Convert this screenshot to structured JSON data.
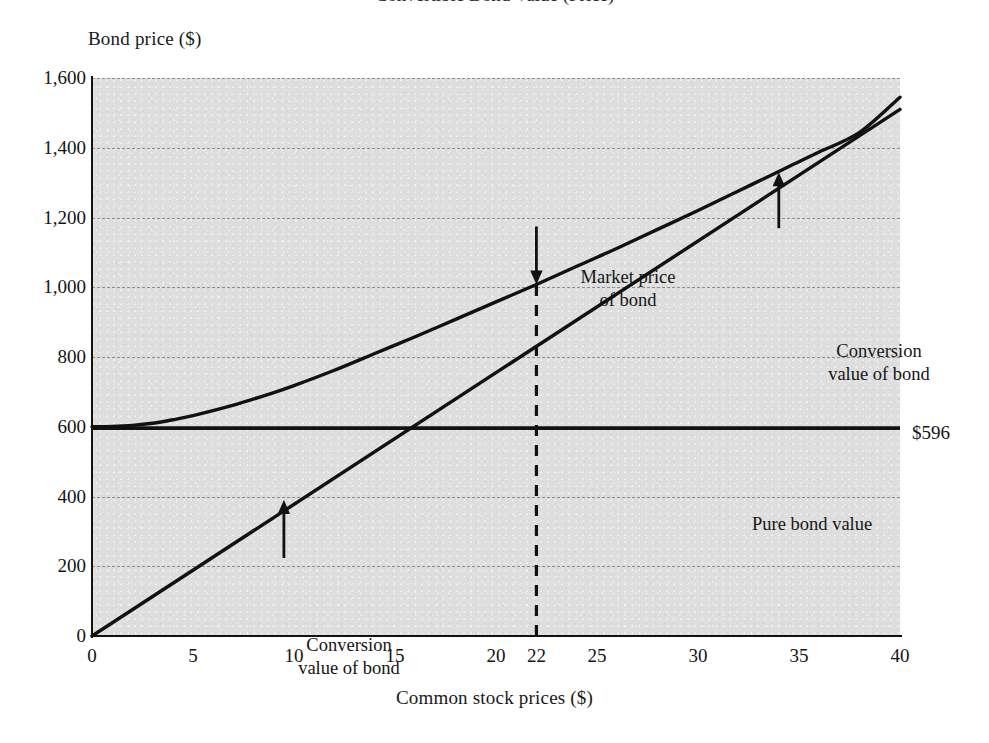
{
  "figure": {
    "title_cut_off": "Convertible Bond Value (Price)",
    "background_color": "#dedede",
    "line_color": "#111111",
    "grid_color": "#8e8e8e"
  },
  "chart_data": {
    "type": "line",
    "title": "",
    "xlabel": "Common stock prices ($)",
    "ylabel": "Bond price ($)",
    "xlim": [
      0,
      40
    ],
    "ylim": [
      0,
      1600
    ],
    "grid": true,
    "legend": "none",
    "xticks": [
      0,
      5,
      10,
      15,
      20,
      22,
      25,
      30,
      35,
      40
    ],
    "xticklabels": [
      "0",
      "5",
      "10",
      "15",
      "20",
      "22",
      "25",
      "30",
      "35",
      "40"
    ],
    "yticks": [
      0,
      200,
      400,
      600,
      800,
      1000,
      1200,
      1400,
      1600
    ],
    "yticklabels": [
      "0",
      "200",
      "400",
      "600",
      "800",
      "1,000",
      "1,200",
      "1,400",
      "1,600"
    ],
    "series": [
      {
        "name": "Market price of bond",
        "style": "solid-curve",
        "x": [
          0,
          1,
          2,
          3,
          4,
          5,
          7,
          9,
          10,
          12,
          14,
          15,
          16,
          18,
          20,
          22,
          24,
          25,
          26,
          28,
          30,
          32,
          34,
          35,
          36,
          38,
          40
        ],
        "values": [
          600,
          601,
          604,
          610,
          620,
          632,
          662,
          698,
          718,
          762,
          810,
          834,
          858,
          908,
          958,
          1008,
          1060,
          1086,
          1112,
          1166,
          1220,
          1276,
          1332,
          1360,
          1388,
          1444,
          1545
        ]
      },
      {
        "name": "Conversion value of bond",
        "style": "solid-straight",
        "x": [
          0,
          40
        ],
        "values": [
          0,
          1510
        ]
      },
      {
        "name": "Pure bond value",
        "style": "solid-horizontal",
        "x": [
          0,
          40
        ],
        "values": [
          596,
          596
        ]
      }
    ],
    "reference_lines": [
      {
        "name": "market-price-marker",
        "orientation": "vertical",
        "style": "dashed",
        "x": 22,
        "y_from": 0,
        "y_to": 1008
      }
    ],
    "annotations": [
      {
        "name": "market-price-of-bond",
        "text_line1": "Market price",
        "text_line2": "of bond",
        "arrow": "down",
        "points_to_x": 22,
        "points_to_y": 1008
      },
      {
        "name": "conversion-value-of-bond-upper",
        "text_line1": "Conversion",
        "text_line2": "value of bond",
        "arrow": "up",
        "points_to_x": 34,
        "points_to_y": 1330
      },
      {
        "name": "conversion-value-of-bond-lower",
        "text_line1": "Conversion",
        "text_line2": "value of bond",
        "arrow": "up",
        "points_to_x": 9.5,
        "points_to_y": 390
      },
      {
        "name": "pure-bond-value",
        "text_line1": "Pure bond value",
        "text_line2": "",
        "arrow": "none",
        "points_to_x": 22,
        "points_to_y": 596
      }
    ],
    "value_labels": [
      {
        "name": "pure-bond-value-amount",
        "text": "$596",
        "at_y": 596
      }
    ]
  }
}
